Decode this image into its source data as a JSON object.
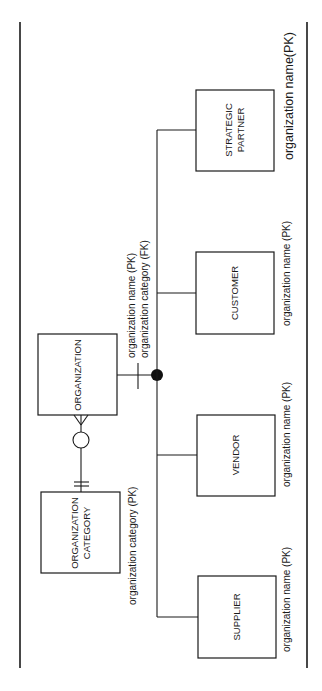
{
  "diagram": {
    "type": "entity-relationship (IDEF1X-style), rotated 90 degrees",
    "entities": {
      "organization_category": {
        "line1": "ORGANIZATION",
        "line2": "CATEGORY",
        "key": "organization category (PK)"
      },
      "organization": {
        "label": "ORGANIZATION",
        "key1": "organization name (PK)",
        "key2": "organization category (FK)"
      },
      "supplier": {
        "label": "SUPPLIER",
        "key": "organization name (PK)"
      },
      "vendor": {
        "label": "VENDOR",
        "key": "organization name (PK)"
      },
      "customer": {
        "label": "CUSTOMER",
        "key": "organization name (PK)"
      },
      "strategic_partner": {
        "line1": "STRATEGIC",
        "line2": "PARTNER",
        "key": "organization name(PK)"
      }
    },
    "relationships": [
      {
        "from": "ORGANIZATION CATEGORY",
        "to": "ORGANIZATION",
        "cardinality": "one-to-zero-or-many"
      },
      {
        "from": "ORGANIZATION",
        "to": [
          "SUPPLIER",
          "VENDOR",
          "CUSTOMER",
          "STRATEGIC PARTNER"
        ],
        "type": "subtype (complete category)"
      }
    ],
    "colors": {
      "ink": "#1a1a1a",
      "background": "#ffffff"
    }
  }
}
